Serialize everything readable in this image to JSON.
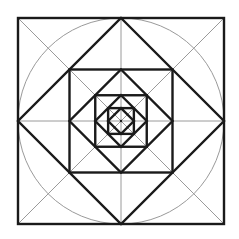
{
  "diagram": {
    "center": [
      121,
      121
    ],
    "outer_half": 103,
    "levels": 4,
    "colors": {
      "background": "#ffffff",
      "heavy": "#1a1a1a",
      "light": "#9a9a9a"
    }
  }
}
